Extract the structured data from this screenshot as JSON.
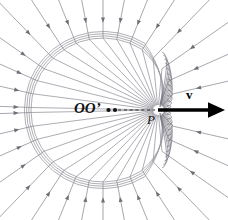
{
  "figure": {
    "background_color": "#ffffff",
    "line_color": "#8a8a93",
    "shock_color": "#9a9aa2",
    "vector_color": "#000000",
    "label_color": "#111111"
  },
  "labels": {
    "origin": "OO’",
    "charge_point": "P",
    "velocity": "v"
  },
  "markers": {
    "origin_dots": 2,
    "charge_point_x": 158,
    "charge_point_y": 110
  },
  "velocity_vector": {
    "from_x": 158,
    "from_y": 110,
    "to_x": 219,
    "to_y": 110,
    "label": "v",
    "style": "solid-bold-arrow"
  },
  "connector": {
    "style": "dashed",
    "from_x": 118,
    "from_y": 110,
    "to_x": 155,
    "to_y": 110
  },
  "chart_data": {
    "type": "line",
    "xlabel": "",
    "ylabel": "",
    "shock_front": {
      "shape": "circle",
      "center_x": 103,
      "center_y": 110,
      "radius": 72,
      "nested_copies": 4,
      "nested_offsets": [
        0,
        2.2,
        4.4,
        6.6
      ]
    },
    "field_line_angles_deg": [
      -90,
      -79,
      -68,
      -57,
      -46,
      -35,
      -24,
      -13,
      13,
      24,
      35,
      46,
      57,
      68,
      79,
      90,
      101,
      112,
      123,
      134,
      145,
      156,
      167,
      178,
      -178,
      -167,
      -156,
      -145,
      -134,
      -123,
      -112,
      -101
    ],
    "compressed_fan_angles_deg": [
      -72,
      -66,
      -60,
      -54,
      -48,
      -42,
      -36,
      -30,
      -24,
      -18,
      -12,
      -6,
      6,
      12,
      18,
      24,
      30,
      36,
      42,
      48,
      54,
      60,
      66,
      72
    ],
    "arrow_direction": "inward (toward P)",
    "legend": []
  }
}
